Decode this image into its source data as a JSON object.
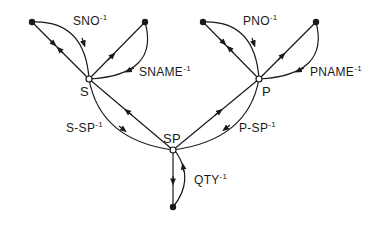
{
  "diagram": {
    "type": "directed graph",
    "nodes": [
      {
        "id": "S",
        "label": "S",
        "kind": "hollow"
      },
      {
        "id": "P",
        "label": "P",
        "kind": "hollow"
      },
      {
        "id": "SP",
        "label": "SP",
        "kind": "hollow"
      },
      {
        "id": "SNO",
        "label": "",
        "kind": "solid"
      },
      {
        "id": "SNAME",
        "label": "",
        "kind": "solid"
      },
      {
        "id": "PNO",
        "label": "",
        "kind": "solid"
      },
      {
        "id": "PNAME",
        "label": "",
        "kind": "solid"
      },
      {
        "id": "QTY",
        "label": "",
        "kind": "solid"
      }
    ],
    "edge_labels": {
      "sno": {
        "base": "SNO",
        "exp": "-1"
      },
      "sname": {
        "base": "SNAME",
        "exp": "-1"
      },
      "pno": {
        "base": "PNO",
        "exp": "-1"
      },
      "pname": {
        "base": "PNAME",
        "exp": "-1"
      },
      "s_sp": {
        "base": "S-SP",
        "exp": "-1"
      },
      "p_sp": {
        "base": "P-SP",
        "exp": "-1"
      },
      "qty": {
        "base": "QTY",
        "exp": "-1"
      }
    },
    "node_labels": {
      "s": "S",
      "p": "P",
      "sp": "SP"
    },
    "colors": {
      "stroke": "#1a1a1a",
      "background": "#ffffff"
    }
  }
}
